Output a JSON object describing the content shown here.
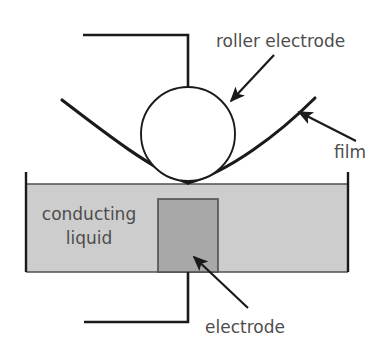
{
  "figure": {
    "background_color": "#ffffff"
  },
  "colors": {
    "stroke": "#1a1a1a",
    "label_text": "#4d4d4d",
    "conducting_liquid_fill": "#cdcdcd",
    "electrode_block_fill": "#a8a8a8",
    "roller_fill": "#ffffff",
    "tank_wall": "#1a1a1a"
  },
  "labels": {
    "roller_electrode": "roller electrode",
    "film": "film",
    "conducting_liquid_line1": "conducting",
    "conducting_liquid_line2": "liquid",
    "electrode": "electrode"
  },
  "parts": {
    "roller": {
      "name": "roller electrode",
      "shape": "circle",
      "cx": 188,
      "cy": 134,
      "r": 47,
      "fill": "#ffffff"
    },
    "top_wire": {
      "name": "top electrode lead wire",
      "points": "83,35 188,35 188,87"
    },
    "bottom_wire": {
      "name": "bottom electrode lead wire",
      "points": "188,272 188,322 84,322"
    },
    "liquid_tank": {
      "name": "conducting liquid bath",
      "x": 26,
      "y": 184,
      "width": 322,
      "height": 88,
      "fill": "#cdcdcd"
    },
    "tank_left_wall": {
      "name": "tank left wall",
      "points": "26,172 26,272"
    },
    "tank_right_wall": {
      "name": "tank right wall",
      "points": "348,172 348,272"
    },
    "electrode_block": {
      "name": "submerged electrode block",
      "x": 158,
      "y": 199,
      "width": 60,
      "height": 73,
      "fill": "#a8a8a8"
    },
    "film_left": {
      "name": "film curve left side",
      "path": "M 62,100 C 105,133 150,168 188,183"
    },
    "film_right": {
      "name": "film curve right side",
      "path": "M 188,183 C 228,172 278,135 315,98"
    }
  },
  "annotations": {
    "roller_arrow": {
      "name": "roller electrode pointer arrow",
      "from_x": 274,
      "from_y": 55,
      "to_x": 231,
      "to_y": 101
    },
    "film_arrow": {
      "name": "film pointer arrow",
      "from_x": 356,
      "from_y": 141,
      "to_x": 299,
      "to_y": 112
    },
    "electrode_arrow": {
      "name": "electrode pointer arrow",
      "from_x": 248,
      "from_y": 308,
      "to_x": 194,
      "to_y": 257
    }
  },
  "label_positions": {
    "roller_electrode": {
      "x": 216,
      "y": 47
    },
    "film": {
      "x": 334,
      "y": 158
    },
    "conducting_liquid": {
      "x": 89,
      "y": 220
    },
    "conducting_liquid_line2_y": 244,
    "electrode": {
      "x": 245,
      "y": 333
    }
  }
}
